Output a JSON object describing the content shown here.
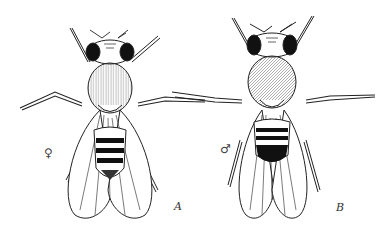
{
  "figure": {
    "panels": [
      {
        "id": "A",
        "label": "A",
        "sex_symbol": "♀",
        "sex": "female"
      },
      {
        "id": "B",
        "label": "B",
        "sex_symbol": "♂",
        "sex": "male"
      }
    ]
  }
}
